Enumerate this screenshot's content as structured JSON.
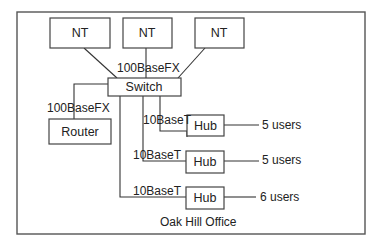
{
  "diagram": {
    "title": "Oak Hill Office",
    "nodes": {
      "nt1": {
        "label": "NT"
      },
      "nt2": {
        "label": "NT"
      },
      "nt3": {
        "label": "NT"
      },
      "switch": {
        "label": "Switch"
      },
      "router": {
        "label": "Router"
      },
      "hub1": {
        "label": "Hub"
      },
      "hub2": {
        "label": "Hub"
      },
      "hub3": {
        "label": "Hub"
      }
    },
    "links": {
      "nt2_switch": "100BaseFX",
      "switch_router": "100BaseFX",
      "switch_hub1": "10BaseT",
      "switch_hub2": "10BaseT",
      "switch_hub3": "10BaseT"
    },
    "users": {
      "hub1": "5 users",
      "hub2": "5 users",
      "hub3": "6 users"
    }
  }
}
